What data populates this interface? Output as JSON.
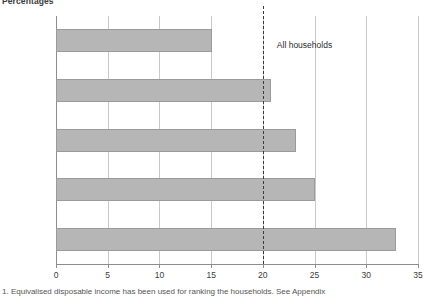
{
  "chart_data": {
    "type": "bar",
    "orientation": "horizontal",
    "title": "Percentages",
    "xlabel": "",
    "ylabel": "",
    "xlim": [
      0,
      35
    ],
    "grid": true,
    "legend": "none",
    "categories": [
      "Top fifth",
      "Next fifth",
      "Middle fifth",
      "Next fifth",
      "Bottom fifth"
    ],
    "values": [
      15.1,
      20.8,
      23.2,
      25.0,
      32.9
    ],
    "xticks": [
      0,
      5,
      10,
      15,
      20,
      25,
      30,
      35
    ],
    "xtick_labels": [
      "0",
      "5",
      "10",
      "15",
      "20",
      "25",
      "30",
      "35"
    ],
    "annotations": [
      {
        "name": "all-households",
        "label": "All households",
        "value": 20.0,
        "style": "dashed-vertical-line"
      }
    ],
    "bar_color": "#b6b6b6",
    "bar_border_color": "#9a9a9a",
    "grid_color": "#c9c9c9",
    "axis_color": "#8d8d8d"
  },
  "footnote": "1. Equivalised disposable income has been used for ranking the households. See Appendix"
}
